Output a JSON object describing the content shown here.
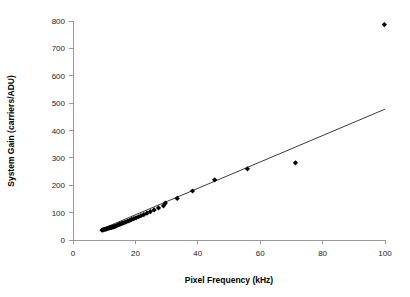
{
  "chart_data": {
    "type": "scatter",
    "title": "",
    "xlabel": "Pixel Frequency (kHz)",
    "ylabel": "System Gain (carriers/ADU)",
    "xlim": [
      0,
      100
    ],
    "ylim": [
      0,
      800
    ],
    "xticks": [
      0,
      20,
      40,
      60,
      80,
      100
    ],
    "yticks": [
      0,
      100,
      200,
      300,
      400,
      500,
      600,
      700,
      800
    ],
    "xtick_labels": [
      "0",
      "20",
      "40",
      "60",
      "80",
      "100"
    ],
    "ytick_labels": [
      "0",
      "100",
      "200",
      "300",
      "400",
      "500",
      "600",
      "700",
      "800"
    ],
    "grid": false,
    "legend": false,
    "legend_position": "none",
    "marker": "diamond",
    "marker_color": "#000000",
    "series": [
      {
        "name": "System Gain",
        "points": [
          [
            9.3,
            36
          ],
          [
            9.6,
            37
          ],
          [
            9.9,
            38
          ],
          [
            10.2,
            39
          ],
          [
            10.5,
            40
          ],
          [
            10.8,
            41
          ],
          [
            11.1,
            42
          ],
          [
            11.4,
            43
          ],
          [
            11.7,
            44
          ],
          [
            12.0,
            45
          ],
          [
            12.3,
            46
          ],
          [
            12.6,
            47
          ],
          [
            12.9,
            48
          ],
          [
            13.2,
            49
          ],
          [
            13.5,
            50
          ],
          [
            13.9,
            52
          ],
          [
            14.3,
            54
          ],
          [
            14.7,
            56
          ],
          [
            15.1,
            58
          ],
          [
            15.5,
            60
          ],
          [
            16.0,
            62
          ],
          [
            16.5,
            64
          ],
          [
            17.0,
            66
          ],
          [
            17.6,
            69
          ],
          [
            18.2,
            72
          ],
          [
            18.8,
            75
          ],
          [
            19.5,
            78
          ],
          [
            20.2,
            81
          ],
          [
            21.0,
            85
          ],
          [
            21.8,
            89
          ],
          [
            22.7,
            93
          ],
          [
            23.7,
            98
          ],
          [
            24.8,
            104
          ],
          [
            26.0,
            110
          ],
          [
            27.4,
            117
          ],
          [
            29.0,
            125
          ],
          [
            29.6,
            135
          ],
          [
            33.4,
            152
          ],
          [
            38.3,
            179
          ],
          [
            45.4,
            220
          ],
          [
            55.9,
            260
          ],
          [
            71.3,
            282
          ],
          [
            99.8,
            787
          ]
        ]
      }
    ],
    "trend_line": {
      "x_start": 9.0,
      "y_start": 39,
      "x_end": 100.0,
      "y_end": 478
    }
  },
  "axis_labels": {
    "x_title": "Pixel Frequency (kHz)",
    "y_title": "System Gain (carriers/ADU)"
  }
}
